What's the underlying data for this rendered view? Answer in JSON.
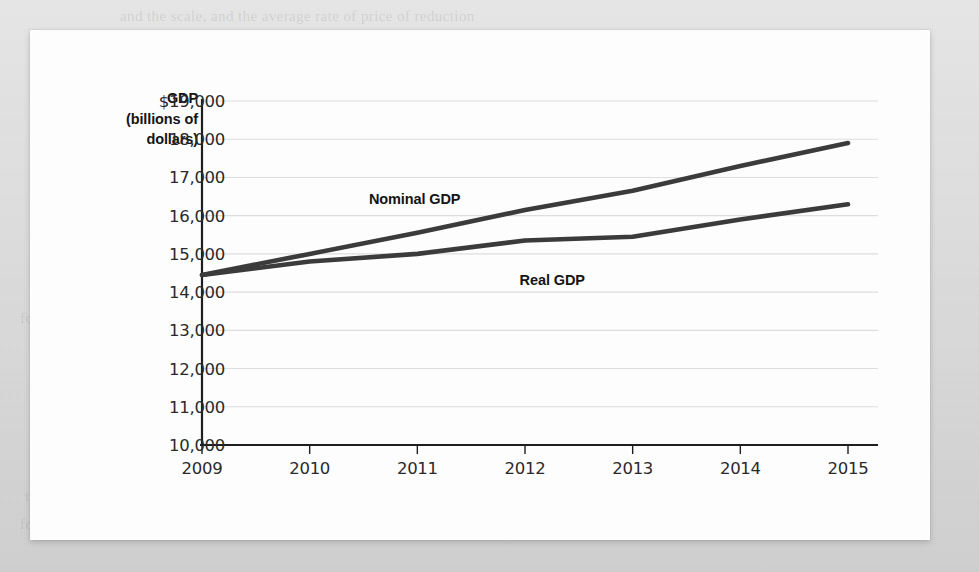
{
  "page": {
    "background_color": "#dcdcdc",
    "paper_color": "#fdfdfd"
  },
  "bleed_text": [
    {
      "text": "and the scale, and the average rate of price of reduction",
      "x": 120,
      "y": 8
    },
    {
      "text": "measured GDP growth over a decade.",
      "x": 210,
      "y": 118
    },
    {
      "text": "We must account for inflation if we are willing to compare the level of",
      "x": 195,
      "y": 198
    },
    {
      "text": "real output in one year with the level of real output in another year.",
      "x": 185,
      "y": 232
    },
    {
      "text": "a rough measure of output and the cost of production is not quantity",
      "x": 70,
      "y": 262
    },
    {
      "text": "for this. Here",
      "x": 20,
      "y": 310
    },
    {
      "text": "is measured in",
      "x": 780,
      "y": 336
    },
    {
      "text": "on the prices at the moment. Real GDP the amount",
      "x": 60,
      "y": 418
    },
    {
      "text": "Recession",
      "x": 820,
      "y": 452
    },
    {
      "text": "the level of investment in a single year is not being an estimate",
      "x": 25,
      "y": 488
    },
    {
      "text": "for goods the prices were differential as well. Real GDP in the pro-",
      "x": 20,
      "y": 516
    }
  ],
  "chart_data": {
    "type": "line",
    "title": "",
    "xlabel": "",
    "ylabel": "GDP (billions of dollars)",
    "ylabel_lines": [
      "GDP",
      "(billions of",
      "dollars)"
    ],
    "categories": [
      2009,
      2010,
      2011,
      2012,
      2013,
      2014,
      2015
    ],
    "x_tick_labels": [
      "2009",
      "2010",
      "2011",
      "2012",
      "2013",
      "2014",
      "2015"
    ],
    "y_tick_labels": [
      "$19,000",
      "18,000",
      "17,000",
      "16,000",
      "15,000",
      "14,000",
      "13,000",
      "12,000",
      "11,000",
      "10,000"
    ],
    "y_tick_values": [
      19000,
      18000,
      17000,
      16000,
      15000,
      14000,
      13000,
      12000,
      11000,
      10000
    ],
    "ylim": [
      10000,
      19000
    ],
    "xlim": [
      2009,
      2015
    ],
    "grid": true,
    "grid_axis": "y",
    "legend": "inline-annotations",
    "line_color": "#3b3b3b",
    "grid_color": "#dedede",
    "axis_color": "#1e1e1e",
    "series": [
      {
        "name": "Nominal GDP",
        "label_x": 2010.55,
        "label_y": 16650,
        "values": [
          14450,
          15000,
          15550,
          16150,
          16650,
          17300,
          17900
        ]
      },
      {
        "name": "Real GDP",
        "label_x": 2011.95,
        "label_y": 14530,
        "values": [
          14450,
          14800,
          15000,
          15350,
          15450,
          15900,
          16300
        ]
      }
    ]
  }
}
